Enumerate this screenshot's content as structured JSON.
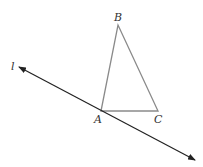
{
  "diagram": {
    "type": "geometry",
    "colors": {
      "triangle": "#8a8a8a",
      "line": "#222222",
      "label": "#333333"
    },
    "points": {
      "A": {
        "label": "A",
        "x": 101,
        "y": 111
      },
      "B": {
        "label": "B",
        "x": 118,
        "y": 25
      },
      "C": {
        "label": "C",
        "x": 158,
        "y": 111
      }
    },
    "line": {
      "label": "l",
      "start": {
        "x": 19,
        "y": 67
      },
      "end": {
        "x": 195,
        "y": 160
      },
      "passes_through": "A",
      "arrows": "both"
    },
    "triangle": [
      "A",
      "B",
      "C"
    ]
  }
}
